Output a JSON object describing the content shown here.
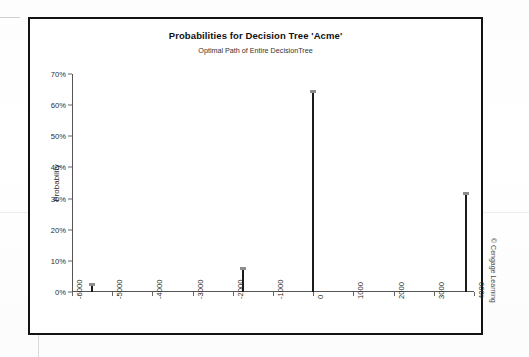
{
  "figure": {
    "copyright": "© Cengage Learning"
  },
  "chart_data": {
    "type": "bar",
    "title": "Probabilities for Decision Tree 'Acme'",
    "subtitle": "Optimal Path of Entire DecisionTree",
    "xlabel": "",
    "ylabel": "Probability",
    "xlim": [
      -6000,
      4000
    ],
    "ylim": [
      0,
      0.7
    ],
    "grid": false,
    "legend": null,
    "ytick_labels": [
      "0%",
      "10%",
      "20%",
      "30%",
      "40%",
      "50%",
      "60%",
      "70%"
    ],
    "ytick_values": [
      0,
      0.1,
      0.2,
      0.3,
      0.4,
      0.5,
      0.6,
      0.7
    ],
    "xtick_labels": [
      "-6000",
      "-5000",
      "-4000",
      "-3000",
      "-2000",
      "-1000",
      "0",
      "1000",
      "2000",
      "3000",
      "4000"
    ],
    "xtick_values": [
      -6000,
      -5000,
      -4000,
      -3000,
      -2000,
      -1000,
      0,
      1000,
      2000,
      3000,
      4000
    ],
    "x": [
      -5500,
      -1750,
      0,
      3800
    ],
    "values": [
      0.02,
      0.07,
      0.64,
      0.31
    ],
    "series": [
      {
        "name": "Probability",
        "points": [
          {
            "x": -5500,
            "y": 0.02
          },
          {
            "x": -1750,
            "y": 0.07
          },
          {
            "x": 0,
            "y": 0.64
          },
          {
            "x": 3800,
            "y": 0.31
          }
        ]
      }
    ]
  }
}
